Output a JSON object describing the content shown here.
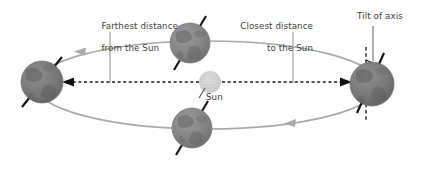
{
  "diagram": {
    "labels": {
      "farthest_line1": "Farthest distance",
      "farthest_line2": "from the Sun",
      "closest_line1": "Closest distance",
      "closest_line2": "to the Sun",
      "tilt": "Tilt of axis",
      "sun": "Sun"
    },
    "bodies": {
      "sun": {
        "name": "Sun",
        "cx": 210,
        "cy": 82,
        "r": 11,
        "color": "#d2d2d2"
      },
      "earth_left": {
        "name": "Earth at aphelion",
        "cx": 42,
        "cy": 82,
        "r": 21,
        "color": "#7c7c7c"
      },
      "earth_top": {
        "name": "Earth upper orbit",
        "cx": 190,
        "cy": 43,
        "r": 20,
        "color": "#8a8a8a"
      },
      "earth_bottom": {
        "name": "Earth lower orbit",
        "cx": 192,
        "cy": 128,
        "r": 20,
        "color": "#8a8a8a"
      },
      "earth_right": {
        "name": "Earth at perihelion",
        "cx": 372,
        "cy": 84,
        "r": 22,
        "color": "#7f7f7f"
      }
    },
    "orbit": {
      "type": "ellipse",
      "cx": 207,
      "cy": 85,
      "rx": 172,
      "ry": 44,
      "color": "#a9a9a9",
      "direction": "counter-clockwise",
      "arrow_top_x": 80,
      "arrow_bottom_x": 292
    },
    "distance_arrows": {
      "color": "#1a1a1a",
      "style": "dashed",
      "y": 82,
      "farthest_from": 199,
      "farthest_to": 66,
      "closest_from": 222,
      "closest_to": 348
    },
    "leader_lines": {
      "color": "#9a9a9a",
      "farthest_x": 110,
      "farthest_top": 32,
      "farthest_bottom": 82,
      "closest_x": 293,
      "closest_top": 32,
      "closest_bottom": 82,
      "tilt_x": 373,
      "tilt_top": 26,
      "tilt_bottom": 60
    },
    "colors": {
      "background": "#ffffff",
      "text": "#3c3c3c",
      "orbit": "#a9a9a9",
      "sun": "#d2d2d2",
      "earth": "#808080",
      "axis": "#111111"
    }
  }
}
